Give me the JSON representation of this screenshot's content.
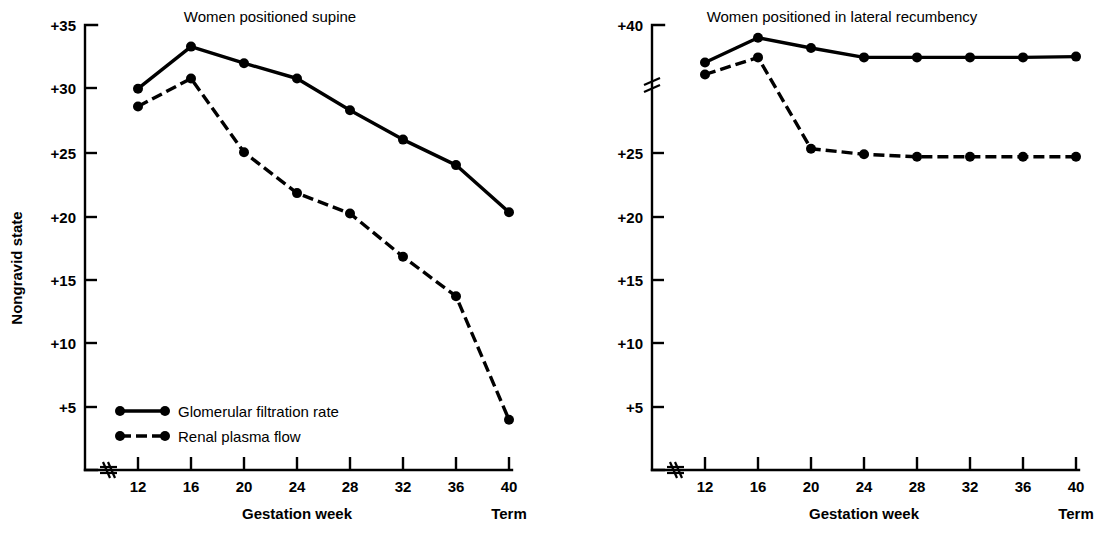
{
  "figure": {
    "y_axis_label": "Nongravid state",
    "x_axis_label": "Gestation week",
    "term_label": "Term",
    "axis_break_icon": "axis-break-squiggle"
  },
  "legend": {
    "items": [
      {
        "label": "Glomerular filtration rate",
        "style": "solid",
        "key": "gfr"
      },
      {
        "label": "Renal plasma flow",
        "style": "dashed",
        "key": "rpf"
      }
    ]
  },
  "chart_data": [
    {
      "id": "supine",
      "type": "line",
      "title": "Women positioned supine",
      "xlabel": "Gestation week",
      "ylabel": "Nongravid state",
      "x": [
        12,
        16,
        20,
        24,
        28,
        32,
        36,
        40
      ],
      "categories": [
        "12",
        "16",
        "20",
        "24",
        "28",
        "32",
        "36",
        "40"
      ],
      "xtick_labels": [
        "12",
        "16",
        "20",
        "24",
        "28",
        "32",
        "36",
        "40"
      ],
      "term_at": "40",
      "ytick_labels": [
        "+5",
        "+10",
        "+15",
        "+20",
        "+25",
        "+30",
        "+35"
      ],
      "yticks": [
        5,
        10,
        15,
        20,
        25,
        30,
        35
      ],
      "ylim": [
        0,
        35
      ],
      "xlim": [
        8,
        42
      ],
      "grid": false,
      "axis_broken": false,
      "legend_position": "inside-lower-left",
      "series": [
        {
          "name": "Glomerular filtration rate",
          "style": "solid",
          "values": [
            30.0,
            33.3,
            32.0,
            30.8,
            28.3,
            26.0,
            24.0,
            20.3
          ]
        },
        {
          "name": "Renal plasma flow",
          "style": "dashed",
          "values": [
            28.6,
            30.8,
            25.0,
            21.8,
            20.2,
            16.8,
            13.7,
            4.0
          ]
        }
      ]
    },
    {
      "id": "lateral-recumbency",
      "type": "line",
      "title": "Women positioned in lateral recumbency",
      "xlabel": "Gestation week",
      "ylabel": "Nongravid state",
      "x": [
        12,
        16,
        20,
        24,
        28,
        32,
        36,
        40
      ],
      "categories": [
        "12",
        "16",
        "20",
        "24",
        "28",
        "32",
        "36",
        "40"
      ],
      "xtick_labels": [
        "12",
        "16",
        "20",
        "24",
        "28",
        "32",
        "36",
        "40"
      ],
      "term_at": "40",
      "ytick_labels": [
        "+5",
        "+10",
        "+15",
        "+20",
        "+25",
        "+40"
      ],
      "yticks": [
        5,
        10,
        15,
        20,
        25,
        40
      ],
      "ylim": [
        0,
        40
      ],
      "xlim": [
        8,
        42
      ],
      "grid": false,
      "axis_broken": true,
      "axis_break_between": [
        25,
        40
      ],
      "legend_position": "none",
      "series": [
        {
          "name": "Glomerular filtration rate",
          "style": "solid",
          "values": [
            35.6,
            38.5,
            37.3,
            36.2,
            36.2,
            36.2,
            36.2,
            36.3
          ]
        },
        {
          "name": "Renal plasma flow",
          "style": "dashed",
          "values": [
            34.2,
            36.2,
            25.5,
            24.9,
            24.7,
            24.7,
            24.7,
            24.7
          ]
        }
      ]
    }
  ]
}
